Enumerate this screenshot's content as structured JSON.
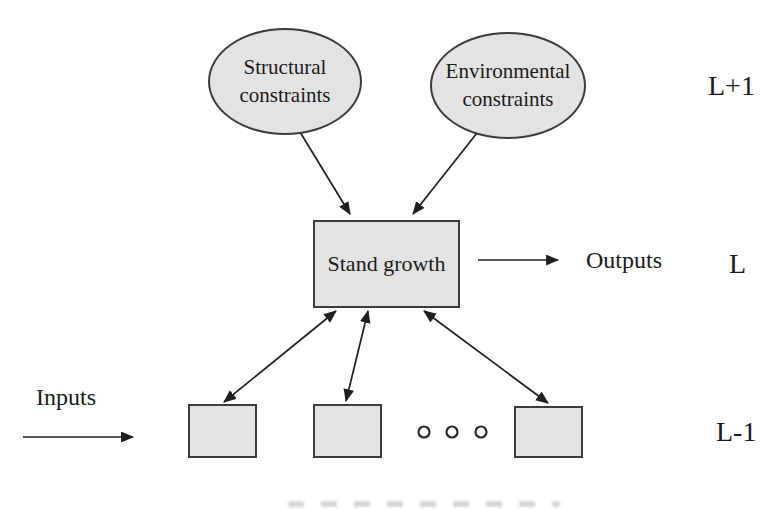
{
  "figure": {
    "type": "hierarchy-diagram",
    "background": "#ffffff",
    "nodes": {
      "structural": {
        "label": "Structural\nconstraints",
        "shape": "ellipse",
        "fill": "#e3e3e3",
        "border": "#3c3c3c"
      },
      "environmental": {
        "label": "Environmental\nconstraints",
        "shape": "ellipse",
        "fill": "#e3e3e3",
        "border": "#3c3c3c"
      },
      "stand_growth": {
        "label": "Stand growth",
        "shape": "rectangle",
        "fill": "#e3e3e3",
        "border": "#3c3c3c"
      },
      "leaf_boxes": {
        "count": 3,
        "label": "",
        "shape": "rectangle",
        "fill": "#e4e4e4",
        "border": "#3c3c3c"
      }
    },
    "flow_labels": {
      "outputs": "Outputs",
      "inputs": "Inputs"
    },
    "level_labels": {
      "top": "L+1",
      "middle": "L",
      "bottom": "L-1"
    },
    "ellipsis_dots": {
      "count": 3,
      "style": "hollow-circle"
    },
    "edges": [
      {
        "from": "structural",
        "to": "stand_growth",
        "heads": "end"
      },
      {
        "from": "environmental",
        "to": "stand_growth",
        "heads": "end"
      },
      {
        "from": "stand_growth",
        "to": "outputs",
        "heads": "end"
      },
      {
        "from": "inputs",
        "to": "leaf-row",
        "heads": "end"
      },
      {
        "from": "stand_growth",
        "to": "leaf-box-1",
        "heads": "both"
      },
      {
        "from": "stand_growth",
        "to": "leaf-box-2",
        "heads": "both"
      },
      {
        "from": "stand_growth",
        "to": "leaf-box-3",
        "heads": "both"
      }
    ],
    "colors": {
      "arrow": "#1f1f1f",
      "text": "#1b1b1b",
      "node_fill": "#e3e3e3",
      "node_border": "#3c3c3c"
    }
  }
}
